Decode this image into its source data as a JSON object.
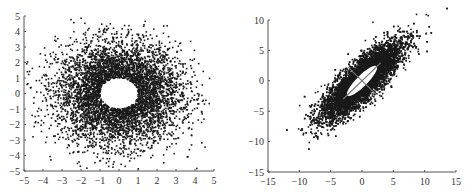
{
  "chart_data": [
    {
      "type": "scatter",
      "title": "",
      "xlabel": "",
      "ylabel": "",
      "xlim": [
        -5,
        5
      ],
      "ylim": [
        -5,
        5
      ],
      "xticks": [
        "-5",
        "-4",
        "-3",
        "-2",
        "-1",
        "0",
        "1",
        "2",
        "3",
        "4",
        "5"
      ],
      "yticks": [
        "5",
        "4",
        "3",
        "2",
        "1",
        "0",
        "-1",
        "-2",
        "-3",
        "-4",
        "-5"
      ],
      "grid": false,
      "legend": null,
      "description": "Dense ring of points around origin with empty hole of radius ~1; points spread to radius ~4.5",
      "series": [
        {
          "name": "samples",
          "distribution": "isotropic gaussian with central hole",
          "center": [
            0,
            0
          ],
          "sigma": 1.6,
          "hole_radius": 1.0,
          "n_points": 5000,
          "color": "#1a1a1a"
        }
      ]
    },
    {
      "type": "scatter",
      "title": "",
      "xlabel": "",
      "ylabel": "",
      "xlim": [
        -15,
        15
      ],
      "ylim": [
        -15,
        10
      ],
      "xticks": [
        "-15",
        "-10",
        "-5",
        "0",
        "5",
        "10",
        "15"
      ],
      "yticks": [
        "10",
        "5",
        "0",
        "-5",
        "-10",
        "-15"
      ],
      "grid": false,
      "legend": null,
      "description": "Elongated ellipse of correlated points along y=x direction, with white ellipse outline and two principal axis lines at center",
      "series": [
        {
          "name": "samples",
          "distribution": "correlated gaussian",
          "center": [
            0,
            0
          ],
          "major_axis_angle_deg": 45,
          "sigma_major": 4.2,
          "sigma_minor": 1.3,
          "n_points": 8000,
          "color": "#1a1a1a"
        }
      ],
      "annotations": [
        {
          "type": "ellipse",
          "center": [
            0,
            0
          ],
          "semi_major": 3.3,
          "semi_minor": 0.9,
          "angle_deg": 45,
          "color": "#ffffff"
        },
        {
          "type": "line",
          "from": [
            -3,
            -3
          ],
          "to": [
            3,
            3
          ],
          "color": "#777777"
        },
        {
          "type": "line",
          "from": [
            -2.2,
            2.2
          ],
          "to": [
            2.2,
            -2.2
          ],
          "color": "#777777"
        }
      ]
    }
  ]
}
